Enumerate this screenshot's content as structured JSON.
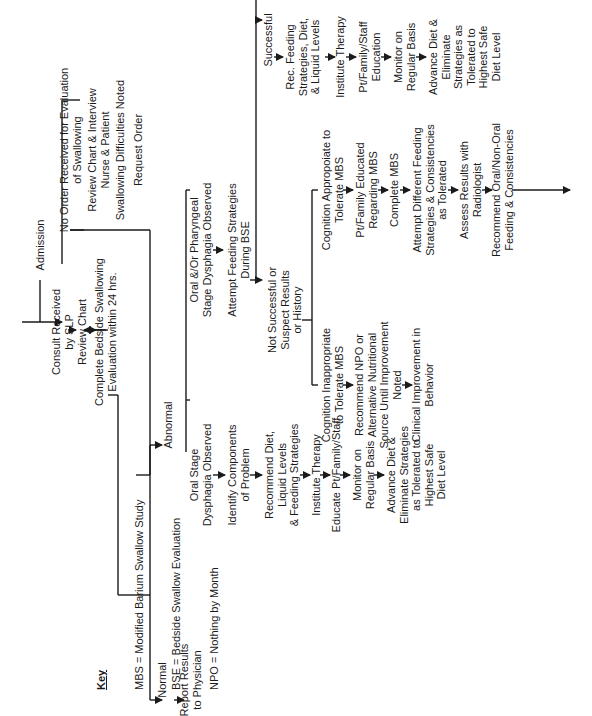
{
  "diagram": {
    "orientation": "rotated 90 degrees counter-clockwise",
    "key": {
      "title": "Key",
      "entries": [
        "MBS = Modified Barium Swallow Study",
        "BSE = Bedside Swallow Evaluation",
        "NPO = Nothing by Month"
      ]
    },
    "nodes": {
      "admission": "Admission",
      "no_order": "No Order Received for Evaluation\nof Swallowing",
      "review_interview": "Review Chart & Interview\nNurse & Patient",
      "difficulties_noted": "Swallowing Difficulties Noted",
      "request_order": "Request Order",
      "consult_received": "Consult Received\nby SLP",
      "review_chart": "Review Chart",
      "complete_bse": "Complete Bedside Swallowing\nEvaluation within 24 hrs.",
      "normal": "Normal",
      "report_results": "Report Results\nto Physician",
      "abnormal": "Abnormal",
      "oral_stage": "Oral Stage\nDysphagia Observed",
      "identify_components": "Identify Components\nof Problem",
      "recommend_diet": "Recommend Diet,\nLiquid Levels\n& Feeding Strategies",
      "institute_therapy_a": "Institute Therapy",
      "educate_family": "Educate Pt/Family/Staff",
      "monitor_a": "Monitor on\nRegular Basis",
      "advance_diet_a": "Advance Diet &\nEliminate Strategies\nas Tolerated to\nHighest Safe\nDiet Level",
      "oral_pharyngeal": "Oral &/Or Pharyngeal\nStage Dysphagia Observed",
      "attempt_feeding": "Attempt Feeding Strategies\nDuring BSE",
      "successful": "Successful",
      "rec_feeding": "Rec. Feeding\nStrategies, Diet,\n& Liquid Levels",
      "institute_therapy_b": "Institute Therapy",
      "pt_family_education": "Pt/Family/Staff\nEducation",
      "monitor_b": "Monitor on\nRegular Basis",
      "advance_diet_b": "Advance Diet &\nEliminate\nStrategies as\nTolerated to\nHighest Safe\nDiet Level",
      "not_successful": "Not Successful or\nSuspect Results\nor History",
      "cognition_appropriate": "Cognition Appropoiate to\nTolerate MBS",
      "pt_family_educated": "Pt/Family Educated\nRegarding MBS",
      "complete_mbs": "Complete MBS",
      "attempt_different": "Attempt Different Feeding\nStrategies & Consistencies\nas Tolerated",
      "assess_results": "Assess Results with\nRadiologist",
      "recommend_oral": "Recommend Oral/Non-Oral\nFeeding & Consistencies",
      "cognition_inappropriate": "Cognition Inappropriate\nto Tolerate MBS",
      "recommend_npo": "Recommend NPO or\nAlternative Nutritional\nSource Until Improvement\nNoted",
      "clinical_improvement": "Clinical Improvement in\nBehavior"
    },
    "colors": {
      "line": "#1a1a1a",
      "text": "#1a1a1a",
      "background": "#ffffff"
    }
  }
}
